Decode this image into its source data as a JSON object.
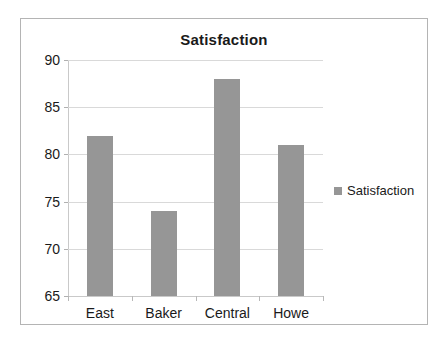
{
  "chart_data": {
    "type": "bar",
    "title": "Satisfaction",
    "categories": [
      "East",
      "Baker",
      "Central",
      "Howe"
    ],
    "values": [
      82,
      74,
      88,
      81
    ],
    "series": [
      {
        "name": "Satisfaction",
        "values": [
          82,
          74,
          88,
          81
        ]
      }
    ],
    "xlabel": "",
    "ylabel": "",
    "ylim": [
      65,
      90
    ],
    "yticks": [
      65,
      70,
      75,
      80,
      85,
      90
    ],
    "ytick_labels": [
      "65",
      "70",
      "75",
      "80",
      "85",
      "90"
    ],
    "grid": true,
    "legend": {
      "position": "right",
      "entries": [
        {
          "label": "Satisfaction",
          "color": "#969696"
        }
      ]
    },
    "colors": {
      "bar": "#969696",
      "gridline": "#d9d9d9",
      "axis": "#c9c9c9",
      "frame_border": "#b4b4b4",
      "background": "#ffffff",
      "text": "#1a1a1a"
    }
  }
}
